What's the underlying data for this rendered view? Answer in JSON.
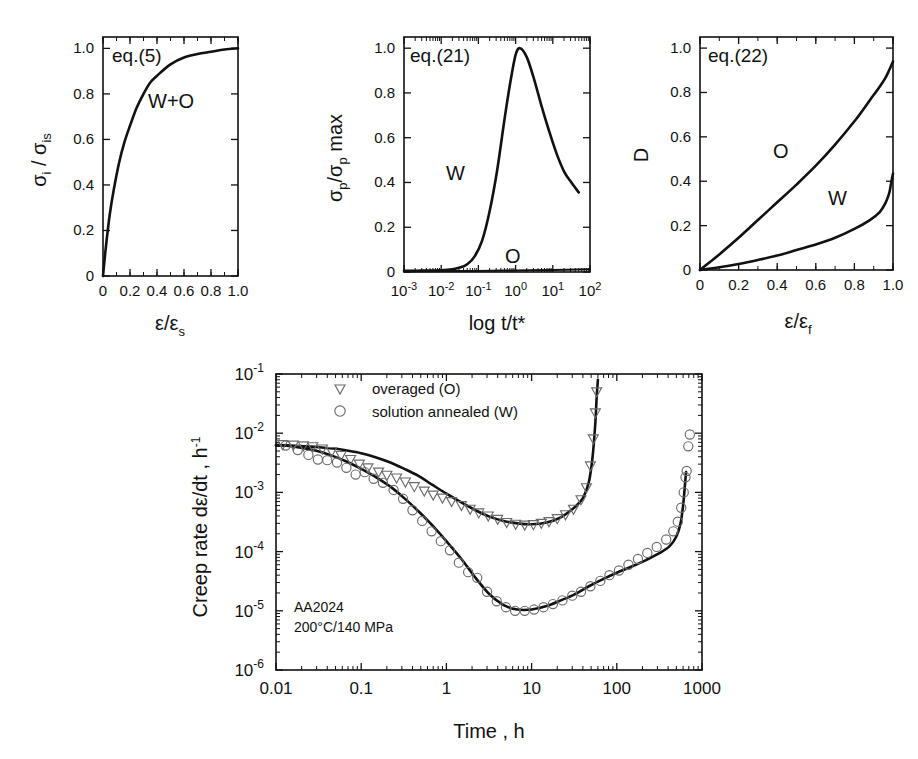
{
  "figure": {
    "background": "#ffffff",
    "ink": "#111111",
    "marker_color": "#6b6b6b"
  },
  "panels": [
    {
      "id": "panel-eq5",
      "equation_label": "eq.(5)",
      "curve_label": "W+O",
      "xlabel_main": "ε/ε",
      "xlabel_sub": "s",
      "ylabel_parts": [
        "σ",
        "i",
        " / ",
        "σ",
        "is"
      ],
      "x_ticks": [
        "0",
        "0.2",
        "0.4",
        "0.6",
        "0.8",
        "1.0"
      ],
      "y_ticks": [
        "0",
        "0.2",
        "0.4",
        "0.6",
        "0.8",
        "1.0"
      ],
      "chart_data": {
        "type": "line",
        "title": "eq.(5)",
        "xlabel": "ε/εs",
        "ylabel": "σi / σis",
        "xlim": [
          0,
          1.0
        ],
        "ylim": [
          0,
          1.05
        ],
        "grid": false,
        "legend": "inline-label",
        "series": [
          {
            "name": "W+O",
            "x": [
              0.0,
              0.02,
              0.05,
              0.08,
              0.12,
              0.16,
              0.2,
              0.25,
              0.3,
              0.35,
              0.4,
              0.5,
              0.6,
              0.7,
              0.8,
              0.9,
              1.0
            ],
            "y": [
              0.0,
              0.12,
              0.27,
              0.38,
              0.5,
              0.59,
              0.66,
              0.74,
              0.8,
              0.85,
              0.88,
              0.93,
              0.96,
              0.975,
              0.985,
              0.995,
              1.0
            ]
          }
        ]
      }
    },
    {
      "id": "panel-eq21",
      "equation_label": "eq.(21)",
      "curve_label_w": "W",
      "curve_label_o": "O",
      "xlabel": "log t/t*",
      "ylabel_parts": [
        "σ",
        "p",
        "/σ",
        "p",
        " max"
      ],
      "x_ticks": [
        "10",
        "10",
        "10",
        "10",
        "10",
        "10"
      ],
      "x_tick_exponents": [
        "-3",
        "-2",
        "-1",
        "0",
        "1",
        "2"
      ],
      "y_ticks": [
        "0",
        "0.2",
        "0.4",
        "0.6",
        "0.8",
        "1.0"
      ],
      "chart_data": {
        "type": "line",
        "title": "eq.(21)",
        "xlabel": "log t/t*",
        "ylabel": "σp/σp max",
        "xlim_log10": [
          -3,
          2
        ],
        "ylim": [
          0,
          1.05
        ],
        "grid": false,
        "series": [
          {
            "name": "W",
            "x_log10": [
              -3.0,
              -2.5,
              -2.0,
              -1.7,
              -1.5,
              -1.3,
              -1.1,
              -0.9,
              -0.7,
              -0.5,
              -0.3,
              -0.15,
              0.0,
              0.12,
              0.3,
              0.5,
              0.7,
              0.9,
              1.1,
              1.3,
              1.5,
              1.7
            ],
            "y": [
              0.005,
              0.006,
              0.008,
              0.012,
              0.02,
              0.035,
              0.07,
              0.14,
              0.27,
              0.45,
              0.68,
              0.84,
              0.97,
              1.0,
              0.96,
              0.86,
              0.74,
              0.63,
              0.53,
              0.45,
              0.4,
              0.355
            ]
          },
          {
            "name": "O",
            "x_log10": [
              -3.0,
              -2.0,
              -1.0,
              0.0,
              1.0,
              2.0
            ],
            "y": [
              0.003,
              0.004,
              0.005,
              0.007,
              0.009,
              0.012
            ]
          }
        ]
      }
    },
    {
      "id": "panel-eq22",
      "equation_label": "eq.(22)",
      "curve_label_o": "O",
      "curve_label_w": "W",
      "xlabel_main": "ε/ε",
      "xlabel_sub": "f",
      "ylabel": "D",
      "x_ticks": [
        "0",
        "0.2",
        "0.4",
        "0.6",
        "0.8",
        "1.0"
      ],
      "y_ticks": [
        "0",
        "0.2",
        "0.4",
        "0.6",
        "0.8",
        "1.0"
      ],
      "chart_data": {
        "type": "line",
        "title": "eq.(22)",
        "xlabel": "ε/εf",
        "ylabel": "D",
        "xlim": [
          0,
          1.0
        ],
        "ylim": [
          0,
          1.05
        ],
        "grid": false,
        "series": [
          {
            "name": "O",
            "x": [
              0.0,
              0.05,
              0.1,
              0.2,
              0.3,
              0.4,
              0.5,
              0.6,
              0.7,
              0.8,
              0.88,
              0.93,
              0.96,
              0.98,
              1.0
            ],
            "y": [
              0.0,
              0.035,
              0.07,
              0.145,
              0.225,
              0.305,
              0.385,
              0.47,
              0.565,
              0.67,
              0.765,
              0.825,
              0.865,
              0.9,
              0.94
            ]
          },
          {
            "name": "W",
            "x": [
              0.0,
              0.1,
              0.2,
              0.3,
              0.4,
              0.5,
              0.6,
              0.7,
              0.8,
              0.88,
              0.93,
              0.96,
              0.98,
              0.99,
              1.0
            ],
            "y": [
              0.0,
              0.012,
              0.027,
              0.045,
              0.065,
              0.09,
              0.115,
              0.145,
              0.185,
              0.225,
              0.26,
              0.3,
              0.345,
              0.39,
              0.435
            ]
          }
        ]
      }
    }
  ],
  "main_plot": {
    "id": "creep-rate-plot",
    "legend": [
      {
        "marker": "triangle-down-marker",
        "label": "overaged (O)"
      },
      {
        "marker": "circle-marker",
        "label": "solution annealed (W)"
      }
    ],
    "annotation": [
      "AA2024",
      "200°C/140 MPa"
    ],
    "xlabel": "Time , h",
    "ylabel_prefix": "Creep rate d",
    "ylabel_eps": "ε",
    "ylabel_mid": "/dt , h",
    "ylabel_exp": "-1",
    "x_ticks": [
      "0.01",
      "0.1",
      "1",
      "10",
      "100",
      "1000"
    ],
    "y_ticks": [
      "10",
      "10",
      "10",
      "10",
      "10",
      "10"
    ],
    "y_tick_exponents": [
      "-1",
      "-2",
      "-3",
      "-4",
      "-5",
      "-6"
    ],
    "chart_data": {
      "type": "line",
      "title": "",
      "xlabel": "Time , h",
      "ylabel": "Creep rate dε/dt , h-1",
      "xscale": "log",
      "yscale": "log",
      "xlim": [
        0.01,
        1000
      ],
      "ylim": [
        1e-06,
        0.1
      ],
      "grid": false,
      "annotations": [
        "AA2024",
        "200°C/140 MPa"
      ],
      "series": [
        {
          "name": "overaged (O) fit",
          "kind": "line",
          "x": [
            0.01,
            0.015,
            0.022,
            0.032,
            0.047,
            0.068,
            0.1,
            0.15,
            0.22,
            0.32,
            0.47,
            0.68,
            1.0,
            1.5,
            2.2,
            3.2,
            4.7,
            6.8,
            10,
            15,
            22,
            32,
            40,
            47,
            52,
            56,
            58,
            60
          ],
          "y": [
            0.0063,
            0.0062,
            0.006,
            0.0058,
            0.0055,
            0.0051,
            0.0046,
            0.0039,
            0.0032,
            0.0025,
            0.0019,
            0.00135,
            0.00095,
            0.00068,
            0.0005,
            0.00039,
            0.00033,
            0.0003,
            0.00029,
            0.00031,
            0.00038,
            0.00056,
            0.0008,
            0.0015,
            0.004,
            0.015,
            0.04,
            0.08
          ]
        },
        {
          "name": "solution annealed (W) fit",
          "kind": "line",
          "x": [
            0.01,
            0.015,
            0.022,
            0.032,
            0.047,
            0.068,
            0.1,
            0.15,
            0.22,
            0.32,
            0.47,
            0.68,
            1.0,
            1.5,
            2.2,
            3.2,
            4.7,
            6.8,
            10,
            15,
            22,
            32,
            47,
            68,
            100,
            150,
            220,
            320,
            420,
            500,
            560,
            600,
            630,
            650
          ],
          "y": [
            0.0063,
            0.006,
            0.0055,
            0.0049,
            0.0041,
            0.0033,
            0.0025,
            0.0018,
            0.00125,
            0.0008,
            0.00048,
            0.00028,
            0.00015,
            7.5e-05,
            3.6e-05,
            1.9e-05,
            1.25e-05,
            1.05e-05,
            1.05e-05,
            1.2e-05,
            1.5e-05,
            1.9e-05,
            2.6e-05,
            3.4e-05,
            4.4e-05,
            5.6e-05,
            7.2e-05,
            9.5e-05,
            0.000125,
            0.00018,
            0.0003,
            0.0006,
            0.0013,
            0.0022
          ]
        },
        {
          "name": "overaged (O) data",
          "kind": "scatter",
          "marker": "triangle-down",
          "x": [
            0.012,
            0.016,
            0.021,
            0.027,
            0.035,
            0.045,
            0.058,
            0.075,
            0.095,
            0.12,
            0.16,
            0.2,
            0.26,
            0.33,
            0.42,
            0.55,
            0.7,
            0.9,
            1.15,
            1.5,
            1.9,
            2.4,
            3.1,
            4.0,
            5.1,
            6.5,
            8.3,
            10.5,
            13,
            16,
            20,
            25,
            31,
            38,
            44,
            49,
            53,
            56,
            58
          ],
          "y": [
            0.0064,
            0.0063,
            0.0061,
            0.0059,
            0.0054,
            0.0049,
            0.0042,
            0.0036,
            0.003,
            0.0026,
            0.0022,
            0.00195,
            0.00175,
            0.0015,
            0.00125,
            0.00105,
            0.0009,
            0.0008,
            0.0007,
            0.0006,
            0.00052,
            0.00045,
            0.0004,
            0.00035,
            0.00031,
            0.00029,
            0.00028,
            0.000285,
            0.0003,
            0.00032,
            0.00036,
            0.00042,
            0.00052,
            0.00075,
            0.0012,
            0.0028,
            0.008,
            0.022,
            0.05
          ]
        },
        {
          "name": "solution annealed (W) data",
          "kind": "scatter",
          "marker": "circle",
          "x": [
            0.013,
            0.018,
            0.024,
            0.031,
            0.04,
            0.052,
            0.067,
            0.086,
            0.11,
            0.14,
            0.18,
            0.24,
            0.31,
            0.4,
            0.52,
            0.67,
            0.86,
            1.1,
            1.4,
            1.8,
            2.3,
            3.0,
            3.9,
            5.0,
            6.4,
            8.3,
            10.7,
            13.8,
            17.8,
            23,
            30,
            38,
            49,
            64,
            82,
            106,
            137,
            177,
            228,
            294,
            380,
            460,
            520,
            570,
            610,
            640,
            660,
            690,
            720
          ],
          "y": [
            0.0062,
            0.0052,
            0.0043,
            0.0036,
            0.0035,
            0.0032,
            0.0026,
            0.002,
            0.0022,
            0.0017,
            0.00145,
            0.0011,
            0.00078,
            0.0005,
            0.00033,
            0.00022,
            0.00015,
            0.000105,
            6.5e-05,
            4.5e-05,
            3.6e-05,
            2.1e-05,
            1.45e-05,
            1.15e-05,
            1e-05,
            1e-05,
            1.05e-05,
            1.15e-05,
            1.3e-05,
            1.5e-05,
            1.8e-05,
            2.1e-05,
            2.6e-05,
            3.2e-05,
            4e-05,
            4.8e-05,
            6e-05,
            7.5e-05,
            9.5e-05,
            0.00012,
            0.00016,
            0.00022,
            0.00032,
            0.00055,
            0.001,
            0.0018,
            0.0023,
            0.006,
            0.0095
          ]
        }
      ]
    }
  }
}
